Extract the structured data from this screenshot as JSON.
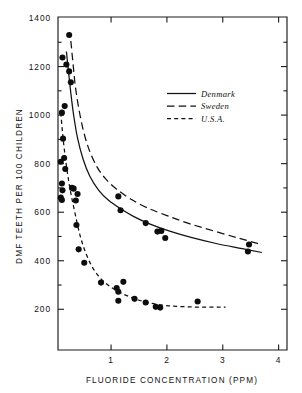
{
  "chart_data": {
    "type": "scatter",
    "title": "",
    "xlabel": "FLUORIDE CONCENTRATION (PPM)",
    "ylabel": "DMF TEETH PER 100 CHILDREN",
    "xlim": [
      0.05,
      4.15
    ],
    "ylim": [
      120,
      1400
    ],
    "xticks": [
      1,
      2,
      3,
      4
    ],
    "xtick_labels": [
      "1",
      "2",
      "3",
      "4"
    ],
    "yticks": [
      200,
      400,
      600,
      800,
      1000,
      1200,
      1400
    ],
    "ytick_labels": [
      "200",
      "400",
      "600",
      "800",
      "1000",
      "1200",
      "1400"
    ],
    "yminorticks": [
      300,
      500,
      700,
      900,
      1100,
      1300
    ],
    "grid": false,
    "legend_position": "upper-right",
    "legend": [
      {
        "label": "Denmark",
        "style": "solid"
      },
      {
        "label": "Sweden",
        "style": "long-dash"
      },
      {
        "label": "U.S.A.",
        "style": "short-dash"
      }
    ],
    "series": [
      {
        "name": "Denmark",
        "style": "solid",
        "marker": "filled-circle",
        "points": [
          [
            0.13,
            1237
          ],
          [
            0.2,
            1208
          ],
          [
            0.25,
            1180
          ],
          [
            0.28,
            1135
          ],
          [
            0.17,
            1037
          ],
          [
            0.12,
            1010
          ],
          [
            0.14,
            903
          ],
          [
            0.1,
            808
          ],
          [
            0.16,
            823
          ],
          [
            0.18,
            778
          ],
          [
            0.12,
            718
          ],
          [
            0.3,
            700
          ],
          [
            0.33,
            697
          ],
          [
            0.13,
            690
          ],
          [
            0.1,
            660
          ],
          [
            0.12,
            650
          ],
          [
            0.4,
            675
          ],
          [
            0.37,
            648
          ],
          [
            1.13,
            665
          ],
          [
            1.17,
            608
          ],
          [
            1.62,
            555
          ],
          [
            1.83,
            520
          ],
          [
            1.9,
            523
          ],
          [
            1.97,
            494
          ],
          [
            3.45,
            438
          ],
          [
            3.47,
            467
          ]
        ]
      },
      {
        "name": "Sweden",
        "style": "long-dash",
        "marker": "filled-circle",
        "points": [
          [
            0.25,
            1330
          ]
        ]
      },
      {
        "name": "U.S.A.",
        "style": "short-dash",
        "marker": "filled-circle",
        "points": [
          [
            0.38,
            547
          ],
          [
            0.42,
            447
          ],
          [
            0.52,
            392
          ],
          [
            0.82,
            310
          ],
          [
            1.1,
            288
          ],
          [
            1.13,
            272
          ],
          [
            1.22,
            313
          ],
          [
            1.13,
            235
          ],
          [
            1.42,
            243
          ],
          [
            1.62,
            228
          ],
          [
            1.8,
            210
          ],
          [
            1.88,
            207
          ],
          [
            2.55,
            232
          ]
        ]
      }
    ],
    "curves": [
      {
        "name": "Denmark",
        "style": "solid",
        "path": [
          [
            0.2,
            1262
          ],
          [
            0.24,
            1175
          ],
          [
            0.28,
            1090
          ],
          [
            0.33,
            1000
          ],
          [
            0.4,
            905
          ],
          [
            0.5,
            818
          ],
          [
            0.62,
            748
          ],
          [
            0.78,
            690
          ],
          [
            0.95,
            650
          ],
          [
            1.15,
            617
          ],
          [
            1.4,
            583
          ],
          [
            1.7,
            551
          ],
          [
            2.05,
            522
          ],
          [
            2.45,
            495
          ],
          [
            2.9,
            470
          ],
          [
            3.35,
            450
          ],
          [
            3.7,
            434
          ]
        ]
      },
      {
        "name": "Sweden",
        "style": "long-dash",
        "path": [
          [
            0.28,
            1305
          ],
          [
            0.32,
            1210
          ],
          [
            0.36,
            1120
          ],
          [
            0.42,
            1030
          ],
          [
            0.5,
            940
          ],
          [
            0.6,
            862
          ],
          [
            0.74,
            790
          ],
          [
            0.9,
            738
          ],
          [
            1.1,
            695
          ],
          [
            1.35,
            654
          ],
          [
            1.65,
            618
          ],
          [
            2.0,
            586
          ],
          [
            2.4,
            553
          ],
          [
            2.85,
            522
          ],
          [
            3.3,
            492
          ],
          [
            3.7,
            466
          ]
        ]
      },
      {
        "name": "U.S.A.",
        "style": "short-dash",
        "path": [
          [
            0.1,
            1010
          ],
          [
            0.13,
            930
          ],
          [
            0.17,
            845
          ],
          [
            0.22,
            760
          ],
          [
            0.28,
            678
          ],
          [
            0.36,
            590
          ],
          [
            0.45,
            500
          ],
          [
            0.56,
            425
          ],
          [
            0.7,
            360
          ],
          [
            0.88,
            312
          ],
          [
            1.1,
            277
          ],
          [
            1.35,
            250
          ],
          [
            1.65,
            228
          ],
          [
            2.0,
            215
          ],
          [
            2.4,
            210
          ],
          [
            2.8,
            209
          ],
          [
            3.05,
            209
          ]
        ]
      }
    ]
  },
  "axes": {
    "x_title": "FLUORIDE CONCENTRATION (PPM)",
    "y_title": "DMF TEETH PER 100 CHILDREN"
  }
}
